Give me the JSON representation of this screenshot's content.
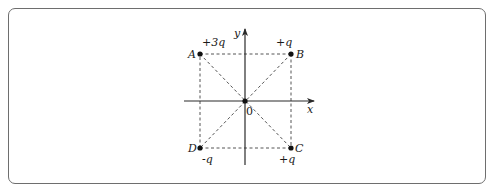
{
  "diagram": {
    "type": "charge-square-coordinate",
    "axes": {
      "x_label": "x",
      "y_label": "y",
      "origin_label": "0"
    },
    "points": [
      {
        "name": "A",
        "charge": "+3q",
        "x": 200,
        "y": 54
      },
      {
        "name": "B",
        "charge": "+q",
        "x": 291,
        "y": 54
      },
      {
        "name": "C",
        "charge": "+q",
        "x": 291,
        "y": 148
      },
      {
        "name": "D",
        "charge": "-q",
        "x": 200,
        "y": 148
      }
    ],
    "origin": {
      "x": 245,
      "y": 101
    },
    "colors": {
      "line": "#3a3a3a",
      "dash": "#555555",
      "frame": "#6e6e6e"
    }
  }
}
